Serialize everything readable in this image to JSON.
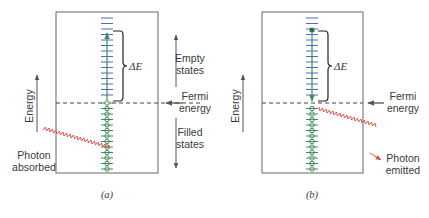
{
  "figure": {
    "panels": [
      {
        "id": "a",
        "caption": "(a)",
        "delta_e_label": "ΔE",
        "energy_axis_label": "Energy",
        "fermi_label_line1": "Fermi",
        "fermi_label_line2": "energy",
        "empty_states_line1": "Empty",
        "empty_states_line2": "states",
        "filled_states_line1": "Filled",
        "filled_states_line2": "states",
        "photon_label_line1": "Photon",
        "photon_label_line2": "absorbed",
        "process": "absorption"
      },
      {
        "id": "b",
        "caption": "(b)",
        "delta_e_label": "ΔE",
        "energy_axis_label": "Energy",
        "fermi_label_line1": "Fermi",
        "fermi_label_line2": "energy",
        "photon_label_line1": "Photon",
        "photon_label_line2": "emitted",
        "process": "emission"
      }
    ],
    "colors": {
      "empty_level": "#4a6fc0",
      "filled_level": "#3f8a5a",
      "photon": "#e0504a",
      "frame": "#555555",
      "text": "#3a3a3a"
    }
  }
}
